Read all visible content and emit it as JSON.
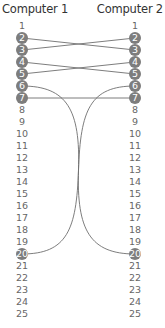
{
  "diagram": {
    "columns": [
      {
        "title": "Computer 1",
        "x": 22
      },
      {
        "title": "Computer 2",
        "x": 135
      }
    ],
    "pins": [
      "1",
      "2",
      "3",
      "4",
      "5",
      "6",
      "7",
      "8",
      "9",
      "10",
      "11",
      "12",
      "13",
      "14",
      "15",
      "16",
      "17",
      "18",
      "19",
      "20",
      "21",
      "22",
      "23",
      "24",
      "25"
    ],
    "active_pins": [
      2,
      3,
      4,
      5,
      6,
      7,
      20
    ],
    "connections": [
      {
        "from": 2,
        "to": 3,
        "type": "straight"
      },
      {
        "from": 3,
        "to": 2,
        "type": "straight"
      },
      {
        "from": 4,
        "to": 5,
        "type": "straight"
      },
      {
        "from": 5,
        "to": 4,
        "type": "straight"
      },
      {
        "from": 6,
        "to": 20,
        "type": "curve"
      },
      {
        "from": 7,
        "to": 7,
        "type": "straight"
      },
      {
        "from": 20,
        "to": 6,
        "type": "curve"
      }
    ],
    "layout": {
      "first_row_y": 26,
      "row_spacing": 12
    },
    "colors": {
      "circle": "#7d7d7d",
      "line": "#6e6e6e",
      "text": "#666666",
      "title": "#333333"
    }
  }
}
